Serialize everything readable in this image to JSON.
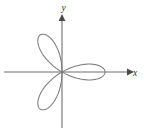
{
  "figure": {
    "background_color": "#ffffff",
    "curve_color": "#7c7c7c",
    "axis_color": "#6f6f6f",
    "label_color": "#2e2e2e"
  },
  "axes": {
    "x_label": "x",
    "y_label": "y",
    "origin": {
      "x": 62,
      "y": 72
    },
    "x_axis": {
      "start_x": 4,
      "end_x": 131,
      "y": 72,
      "arrow": "right"
    },
    "y_axis": {
      "x": 62,
      "start_y": 128,
      "end_y": 17,
      "arrow": "up"
    }
  },
  "chart_data": {
    "type": "line",
    "title": "",
    "xlabel": "x",
    "ylabel": "y",
    "grid": false,
    "legend": "none",
    "curve_name": "three-petaled rose",
    "polar_equation": "r = a*sin(3*theta)",
    "petal_count": 3,
    "petal_directions_deg": [
      35,
      145,
      270
    ],
    "petal_tip_points_px": [
      {
        "x": 99,
        "y": 57
      },
      {
        "x": 21,
        "y": 58
      },
      {
        "x": 62,
        "y": 112
      }
    ],
    "xlim": [
      -62,
      82
    ],
    "ylim": [
      -65,
      72
    ],
    "amplitude_px": 43,
    "path": "M 62 72 C 58 60, 40 46, 29 49 C 18 52, 19 63, 32 68 C 43 72, 57 74, 62 72 C 67 74, 81 72, 92 68 C 105 63, 106 52, 95 49 C 84 46, 66 60, 62 72 C 56 76, 49 90, 49 99 C 49 108, 55 113, 62 113 C 69 113, 75 108, 75 99 C 75 90, 68 76, 62 72 Z"
  }
}
